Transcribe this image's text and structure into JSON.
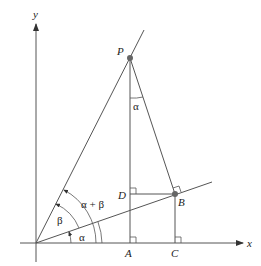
{
  "diagram": {
    "axes": {
      "x_label": "x",
      "y_label": "y"
    },
    "points": {
      "P": "P",
      "B": "B",
      "D": "D",
      "A": "A",
      "C": "C"
    },
    "angles": {
      "alpha_bottom": "α",
      "beta": "β",
      "alpha_plus_beta": "α + β",
      "alpha_top": "α"
    },
    "colors": {
      "line": "#555555",
      "point": "#666666",
      "text": "#222222",
      "background": "#ffffff"
    }
  }
}
